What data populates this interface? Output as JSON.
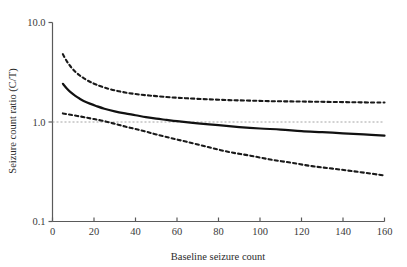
{
  "chart_data": {
    "type": "line",
    "title": "",
    "xlabel": "Baseline seizure count",
    "ylabel": "Seizure count ratio (C/T)",
    "xlim": [
      0,
      160
    ],
    "ylim": [
      0.1,
      10.0
    ],
    "yscale": "log",
    "xscale": "linear",
    "grid": false,
    "legend": null,
    "xticks": [
      0,
      20,
      40,
      60,
      80,
      100,
      120,
      140,
      160
    ],
    "xtick_labels": [
      "0",
      "20",
      "40",
      "60",
      "80",
      "100",
      "120",
      "140",
      "160"
    ],
    "yticks": [
      0.1,
      1.0,
      10.0
    ],
    "ytick_labels": [
      "0.1",
      "1.0",
      "10.0"
    ],
    "reference_line": {
      "name": "unity-reference-line",
      "y": 1.0,
      "style": "dotted",
      "color": "#9a9a9a"
    },
    "series": [
      {
        "name": "Upper 95% confidence limit",
        "style": "dashed",
        "color": "#1a1a1a",
        "x": [
          5,
          7,
          9,
          11,
          13,
          15,
          18,
          21,
          25,
          30,
          35,
          40,
          45,
          50,
          57,
          65,
          75,
          85,
          95,
          105,
          115,
          125,
          135,
          145,
          155,
          160
        ],
        "y": [
          4.8,
          4.05,
          3.55,
          3.2,
          2.95,
          2.76,
          2.54,
          2.38,
          2.22,
          2.08,
          1.98,
          1.91,
          1.86,
          1.82,
          1.77,
          1.73,
          1.69,
          1.66,
          1.64,
          1.62,
          1.61,
          1.6,
          1.59,
          1.58,
          1.57,
          1.57
        ]
      },
      {
        "name": "Estimated seizure count ratio (C/T)",
        "style": "solid",
        "color": "#111111",
        "x": [
          5,
          7,
          9,
          11,
          13,
          15,
          18,
          21,
          25,
          30,
          35,
          40,
          45,
          50,
          55,
          60,
          70,
          80,
          90,
          100,
          110,
          120,
          130,
          140,
          150,
          160
        ],
        "y": [
          2.42,
          2.16,
          1.97,
          1.83,
          1.72,
          1.63,
          1.53,
          1.45,
          1.36,
          1.28,
          1.22,
          1.17,
          1.12,
          1.08,
          1.05,
          1.02,
          0.97,
          0.93,
          0.89,
          0.86,
          0.84,
          0.81,
          0.79,
          0.77,
          0.75,
          0.73
        ]
      },
      {
        "name": "Lower 95% confidence limit",
        "style": "dashed",
        "color": "#1a1a1a",
        "x": [
          5,
          8,
          12,
          16,
          20,
          25,
          30,
          35,
          40,
          45,
          50,
          57,
          65,
          75,
          85,
          95,
          105,
          115,
          125,
          135,
          145,
          155,
          160
        ],
        "y": [
          1.22,
          1.19,
          1.15,
          1.11,
          1.07,
          1.02,
          0.96,
          0.9,
          0.85,
          0.8,
          0.75,
          0.69,
          0.63,
          0.56,
          0.5,
          0.46,
          0.42,
          0.39,
          0.36,
          0.34,
          0.32,
          0.3,
          0.29
        ]
      }
    ]
  },
  "axes": {
    "x_axis_name": "x-axis",
    "y_axis_name": "y-axis"
  }
}
